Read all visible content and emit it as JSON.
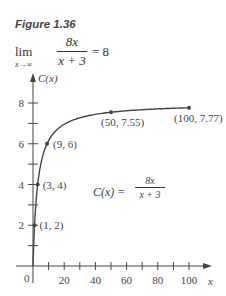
{
  "figure": {
    "title": "Figure 1.36",
    "limit": {
      "lim": "lim",
      "sub": "x→∞",
      "numerator": "8x",
      "denominator": "x + 3",
      "result": "= 8"
    },
    "function_label": {
      "lhs": "C(x) =",
      "numerator": "8x",
      "denominator": "x + 3"
    }
  },
  "chart_data": {
    "type": "line",
    "title": "",
    "xlabel": "x",
    "ylabel": "C(x)",
    "xlim": [
      0,
      100
    ],
    "ylim": [
      0,
      8
    ],
    "x_ticks": [
      10,
      20,
      30,
      40,
      50,
      60,
      70,
      80,
      90,
      100
    ],
    "x_tick_labels": [
      "20",
      "40",
      "60",
      "80",
      "100"
    ],
    "x_tick_label_values": [
      20,
      40,
      60,
      80,
      100
    ],
    "y_ticks": [
      1,
      2,
      3,
      4,
      5,
      6,
      7,
      8
    ],
    "y_tick_labels": [
      "2",
      "4",
      "6",
      "8"
    ],
    "y_tick_label_values": [
      2,
      4,
      6,
      8
    ],
    "origin_label": "0",
    "function": "C(x) = 8x / (x + 3)",
    "points": [
      {
        "x": 1,
        "y": 2,
        "label": "(1, 2)"
      },
      {
        "x": 3,
        "y": 4,
        "label": "(3, 4)"
      },
      {
        "x": 9,
        "y": 6,
        "label": "(9, 6)"
      },
      {
        "x": 50,
        "y": 7.55,
        "label": "(50, 7.55)"
      },
      {
        "x": 100,
        "y": 7.77,
        "label": "(100, 7.77)"
      }
    ],
    "grid": false,
    "color": "#444444"
  }
}
